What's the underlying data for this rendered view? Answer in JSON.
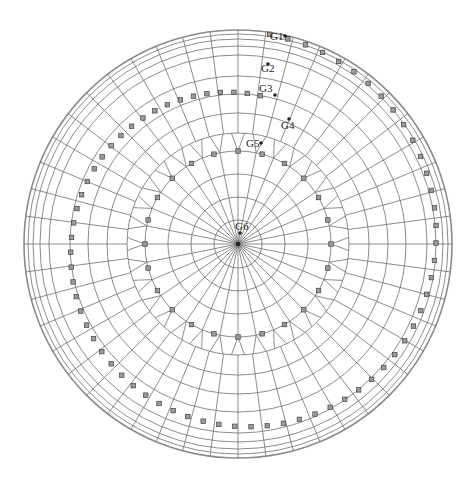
{
  "diagram": {
    "type": "polar finite-element mesh",
    "center": [
      238,
      244
    ],
    "outer_radius": 214,
    "inner_rings": [
      24,
      47,
      70,
      93
    ],
    "mid_rings": [
      111,
      131,
      150,
      168,
      189
    ],
    "outer_rings": [
      198,
      205,
      210,
      214
    ],
    "inner_spokes": 32,
    "outer_spokes": 48,
    "transition_radius": 93,
    "marker_color": "#9a9a9a",
    "line_color": "#6e6e6e"
  },
  "marker_paths": [
    {
      "name": "inner-marker-ring",
      "radius": 93,
      "count": 24
    },
    {
      "name": "spiral-marker-path",
      "r_start": 150,
      "r_end": 212,
      "turns": 1.0,
      "count": 72
    }
  ],
  "gauges": [
    {
      "id": "G1",
      "label": "G1",
      "label_xy": [
        270,
        40
      ],
      "dot_xy": [
        285,
        36
      ]
    },
    {
      "id": "G2",
      "label": "G2",
      "label_xy": [
        261,
        72
      ],
      "dot_xy": [
        268,
        64
      ]
    },
    {
      "id": "G3",
      "label": "G3",
      "label_xy": [
        259,
        92
      ],
      "dot_xy": [
        275,
        95
      ]
    },
    {
      "id": "G4",
      "label": "G4",
      "label_xy": [
        281,
        129
      ],
      "dot_xy": [
        289,
        119
      ]
    },
    {
      "id": "G5",
      "label": "G5",
      "label_xy": [
        246,
        147
      ],
      "dot_xy": [
        261,
        143
      ]
    },
    {
      "id": "G6",
      "label": "G6",
      "label_xy": [
        235,
        230
      ],
      "dot_xy": [
        240,
        233
      ]
    }
  ]
}
